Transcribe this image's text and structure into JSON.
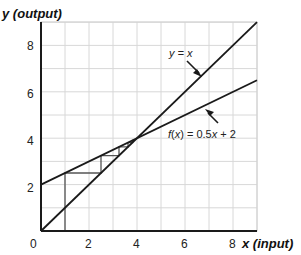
{
  "chart_data": {
    "type": "line",
    "title": "",
    "xlabel": "x (input)",
    "ylabel": "y (output)",
    "xlabel_parts": {
      "var": "x",
      "paren": "(input)"
    },
    "ylabel_parts": {
      "var": "y",
      "paren": "(output)"
    },
    "xlim": [
      0,
      9
    ],
    "ylim": [
      0,
      9
    ],
    "grid": true,
    "grid_step": 1,
    "xticks": [
      0,
      2,
      4,
      6,
      8
    ],
    "yticks": [
      2,
      4,
      6,
      8
    ],
    "xtick_labels": [
      "0",
      "2",
      "4",
      "6",
      "8"
    ],
    "ytick_labels": [
      "2",
      "4",
      "6",
      "8"
    ],
    "series": [
      {
        "name": "y = x",
        "x": [
          0,
          9
        ],
        "y": [
          0,
          9
        ]
      },
      {
        "name": "f(x) = 0.5x + 2",
        "x": [
          0,
          9
        ],
        "y": [
          2,
          6.5
        ]
      }
    ],
    "cobweb": {
      "start_x": 1,
      "path": [
        [
          1,
          0
        ],
        [
          1,
          2.5
        ],
        [
          2.5,
          2.5
        ],
        [
          2.5,
          3.25
        ],
        [
          3.25,
          3.25
        ],
        [
          3.25,
          3.625
        ],
        [
          3.625,
          3.625
        ],
        [
          3.625,
          3.8125
        ],
        [
          3.8125,
          3.8125
        ],
        [
          3.8125,
          3.90625
        ],
        [
          3.90625,
          3.90625
        ]
      ]
    },
    "fixed_point": [
      4,
      4
    ],
    "annotations": [
      {
        "text": "y = x",
        "points_to": "y = x",
        "label_at": [
          6.4,
          7.8
        ],
        "arrow_tip": [
          7.1,
          6.9
        ]
      },
      {
        "text": "f(x) = 0.5x + 2",
        "points_to": "f(x) = 0.5x + 2",
        "label_at": [
          6.0,
          4.1
        ],
        "arrow_tip": [
          6.8,
          5.45
        ]
      }
    ]
  },
  "labels": {
    "y_axis_var": "y",
    "y_axis_paren": "(output)",
    "x_axis_var": "x",
    "x_axis_paren": "(input)",
    "line1": "y = x",
    "line2_f": "f",
    "line2_x": "x",
    "line2_rest": " = 0.5",
    "line2_x2": "x",
    "line2_tail": " + 2",
    "tick_0": "0",
    "tick_x2": "2",
    "tick_x4": "4",
    "tick_x6": "6",
    "tick_x8": "8",
    "tick_y2": "2",
    "tick_y4": "4",
    "tick_y6": "6",
    "tick_y8": "8"
  },
  "colors": {
    "grid": "#d8d8d8",
    "line": "#1a1a1a",
    "cobweb": "#555555",
    "text": "#222222"
  }
}
